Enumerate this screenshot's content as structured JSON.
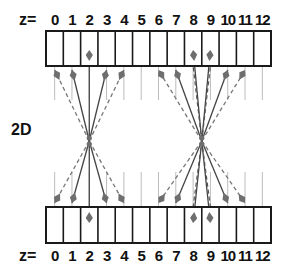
{
  "diagram": {
    "side_label": "2D",
    "top_row": {
      "prefix": "z=",
      "indices": [
        "0",
        "1",
        "2",
        "3",
        "4",
        "5",
        "6",
        "7",
        "8",
        "9",
        "10",
        "11",
        "12"
      ]
    },
    "bottom_row": {
      "prefix": "z=",
      "indices": [
        "0",
        "1",
        "2",
        "3",
        "4",
        "5",
        "6",
        "7",
        "8",
        "9",
        "10",
        "11",
        "12"
      ]
    },
    "cell_count": 13,
    "focal_groups": [
      {
        "name": "left-focus",
        "center_cells": [
          2
        ],
        "solid_arrow_cells": [
          1,
          3
        ],
        "dashed_arrow_cells": [
          0,
          4
        ]
      },
      {
        "name": "right-focus",
        "center_cells": [
          8,
          9
        ],
        "solid_arrow_cells": [
          7,
          10
        ],
        "dashed_arrow_cells": [
          6,
          11
        ]
      }
    ],
    "colors": {
      "box_stroke": "#1a1a1a",
      "arrow": "#6e6e6e",
      "guide_line": "#bdbdbd",
      "text": "#111111"
    }
  }
}
